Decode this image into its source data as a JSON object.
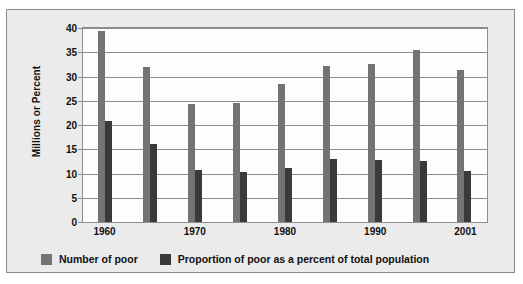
{
  "chart_data": {
    "type": "bar",
    "title": "",
    "xlabel": "",
    "ylabel": "Millions or Percent",
    "ylim": [
      0,
      40
    ],
    "ytick_labels": [
      "40",
      "35",
      "30",
      "25",
      "20",
      "15",
      "10",
      "5",
      "0"
    ],
    "ytick_values": [
      40,
      35,
      30,
      25,
      20,
      15,
      10,
      5,
      0
    ],
    "grid": true,
    "legend_position": "bottom-left",
    "categories": [
      "1960",
      "",
      "1970",
      "",
      "1980",
      "",
      "1990",
      "",
      "2001"
    ],
    "visible_xtick_labels": [
      "1960",
      "1970",
      "1980",
      "1990",
      "2001"
    ],
    "series": [
      {
        "name": "Number of poor",
        "color": "#737373",
        "values": [
          39.5,
          32.2,
          24.5,
          24.7,
          28.6,
          32.4,
          32.8,
          35.6,
          31.6
        ]
      },
      {
        "name": "Proportion of poor as a percent of total population",
        "color": "#3a3a3a",
        "values": [
          21.0,
          16.1,
          10.8,
          10.3,
          11.1,
          13.0,
          12.8,
          12.7,
          10.5
        ]
      }
    ]
  },
  "colors": {
    "series_0": "#737373",
    "series_1": "#3a3a3a",
    "frame_background": "#ebebeb",
    "plot_background": "#fdfdfd",
    "gridline": "#8d8d8d"
  }
}
